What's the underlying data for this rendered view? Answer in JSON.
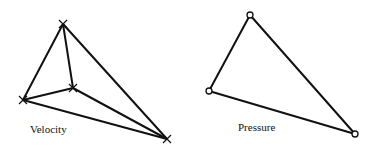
{
  "diagrams": [
    {
      "id": "velocity",
      "label": "Velocity",
      "label_pos": [
        30,
        133
      ],
      "marker": "cross",
      "nodes": [
        [
          63,
          24
        ],
        [
          23,
          100
        ],
        [
          73,
          88
        ],
        [
          167,
          139
        ]
      ],
      "edges": [
        [
          0,
          1
        ],
        [
          0,
          2
        ],
        [
          0,
          3
        ],
        [
          1,
          2
        ],
        [
          1,
          3
        ],
        [
          2,
          3
        ]
      ]
    },
    {
      "id": "pressure",
      "label": "Pressure",
      "label_pos": [
        238,
        131
      ],
      "marker": "circle",
      "nodes": [
        [
          250,
          15
        ],
        [
          209,
          91
        ],
        [
          355,
          134
        ]
      ],
      "edges": [
        [
          0,
          1
        ],
        [
          0,
          2
        ],
        [
          1,
          2
        ]
      ]
    }
  ]
}
